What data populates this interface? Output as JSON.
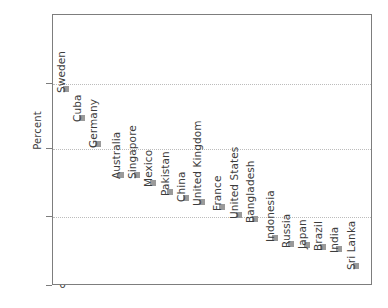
{
  "chart_data": {
    "type": "scatter",
    "title": "",
    "xlabel": "",
    "ylabel": "Percent",
    "ylim": [
      0,
      52
    ],
    "yticks": [
      0,
      15,
      30,
      45
    ],
    "ytick_labels": [
      "0",
      "15",
      "30",
      "45"
    ],
    "grid": "horizontal-dotted",
    "legend": "none",
    "xaxis_ticks": "none",
    "marker_color": "#9a9a9a",
    "axis_color": "#7d7d7d",
    "gridline_color": "#bcbcbc",
    "text_color": "#3c3c3c",
    "categories": [
      "Sweden",
      "Cuba",
      "Germany",
      "Australia",
      "Singapore",
      "Mexico",
      "Pakistan",
      "China",
      "United Kingdom",
      "France",
      "United States",
      "Bangladesh",
      "Indonesia",
      "Russia",
      "Japan",
      "Brazil",
      "India",
      "Sri Lanka"
    ],
    "values": [
      43.8,
      37.4,
      31.5,
      24.8,
      24.8,
      22.9,
      21.0,
      19.7,
      18.9,
      17.8,
      15.9,
      15.0,
      10.8,
      9.4,
      9.2,
      8.8,
      8.3,
      4.7
    ],
    "points": [
      {
        "label": "Sweden",
        "value": 43.8,
        "x_px": 65,
        "y_px": 88
      },
      {
        "label": "Cuba",
        "value": 37.4,
        "x_px": 81,
        "y_px": 117
      },
      {
        "label": "Germany",
        "value": 31.5,
        "x_px": 97,
        "y_px": 143
      },
      {
        "label": "Australia",
        "value": 24.8,
        "x_px": 120,
        "y_px": 174
      },
      {
        "label": "Singapore",
        "value": 24.8,
        "x_px": 136,
        "y_px": 174
      },
      {
        "label": "Mexico",
        "value": 22.9,
        "x_px": 152,
        "y_px": 182
      },
      {
        "label": "Pakistan",
        "value": 21.0,
        "x_px": 169,
        "y_px": 191
      },
      {
        "label": "China",
        "value": 19.7,
        "x_px": 185,
        "y_px": 197
      },
      {
        "label": "United Kingdom",
        "value": 18.9,
        "x_px": 201,
        "y_px": 201
      },
      {
        "label": "France",
        "value": 17.8,
        "x_px": 221,
        "y_px": 206
      },
      {
        "label": "United States",
        "value": 15.9,
        "x_px": 238,
        "y_px": 214
      },
      {
        "label": "Bangladesh",
        "value": 15.0,
        "x_px": 254,
        "y_px": 218
      },
      {
        "label": "Indonesia",
        "value": 10.8,
        "x_px": 274,
        "y_px": 237
      },
      {
        "label": "Russia",
        "value": 9.4,
        "x_px": 290,
        "y_px": 243
      },
      {
        "label": "Japan",
        "value": 9.2,
        "x_px": 306,
        "y_px": 244
      },
      {
        "label": "Brazil",
        "value": 8.8,
        "x_px": 322,
        "y_px": 246
      },
      {
        "label": "India",
        "value": 8.3,
        "x_px": 338,
        "y_px": 248
      },
      {
        "label": "Sri Lanka",
        "value": 4.7,
        "x_px": 355,
        "y_px": 265
      }
    ]
  },
  "axes": {
    "y_title": "Percent",
    "y_ticks": [
      {
        "label": "45",
        "value": 45,
        "y_px": 83
      },
      {
        "label": "30",
        "value": 30,
        "y_px": 148
      },
      {
        "label": "15",
        "value": 15,
        "y_px": 216
      },
      {
        "label": "0",
        "value": 0,
        "y_px": 285
      }
    ]
  }
}
